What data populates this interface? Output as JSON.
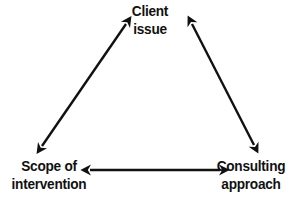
{
  "diagram": {
    "type": "triangle-relationship",
    "background_color": "#ffffff",
    "line_color": "#111111",
    "nodes": [
      {
        "id": "client-issue",
        "line1": "Client",
        "line2": "issue",
        "position": "top-center"
      },
      {
        "id": "scope-of-intervention",
        "line1": "Scope of",
        "line2": "intervention",
        "position": "bottom-left"
      },
      {
        "id": "consulting-approach",
        "line1": "Consulting",
        "line2": "approach",
        "position": "bottom-right"
      }
    ],
    "connectors": [
      {
        "id": "scope-to-client",
        "name": "left-diagonal-double-arrow",
        "from": "scope-of-intervention",
        "to": "client-issue",
        "style": "double-headed",
        "x1": 42,
        "y1": 146,
        "x2": 126,
        "y2": 24
      },
      {
        "id": "client-to-consulting",
        "name": "right-diagonal-double-arrow",
        "from": "client-issue",
        "to": "consulting-approach",
        "style": "double-headed",
        "x1": 192,
        "y1": 24,
        "x2": 254,
        "y2": 145
      },
      {
        "id": "scope-to-consulting",
        "name": "bottom-horizontal-double-arrow",
        "from": "scope-of-intervention",
        "to": "consulting-approach",
        "style": "double-headed",
        "x1": 90,
        "y1": 170,
        "x2": 220,
        "y2": 170
      }
    ]
  }
}
